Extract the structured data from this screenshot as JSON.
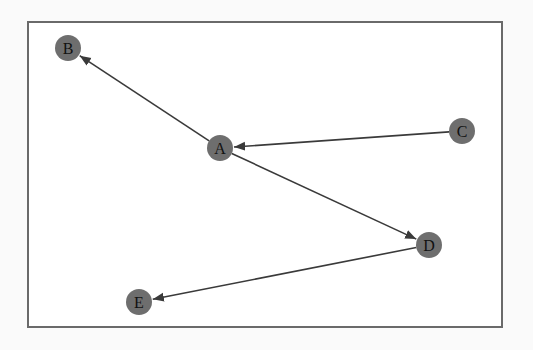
{
  "diagram": {
    "type": "directed-graph",
    "node_color": "#6e6e6e",
    "edge_color": "#3a3a3a",
    "nodes": [
      {
        "id": "A",
        "label": "A",
        "x": 220,
        "y": 148
      },
      {
        "id": "B",
        "label": "B",
        "x": 68,
        "y": 48
      },
      {
        "id": "C",
        "label": "C",
        "x": 462,
        "y": 131
      },
      {
        "id": "D",
        "label": "D",
        "x": 429,
        "y": 245
      },
      {
        "id": "E",
        "label": "E",
        "x": 139,
        "y": 302
      }
    ],
    "edges": [
      {
        "from": "A",
        "to": "B"
      },
      {
        "from": "C",
        "to": "A"
      },
      {
        "from": "A",
        "to": "D"
      },
      {
        "from": "D",
        "to": "E"
      }
    ]
  }
}
